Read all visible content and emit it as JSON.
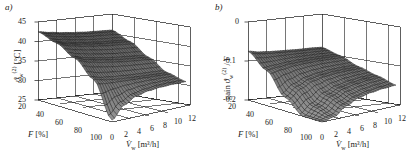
{
  "figure": {
    "background": "#ffffff",
    "ink": "#1a1a1a",
    "surface_mesh_color": "#1c1c1c",
    "surface_fill_color": "#8a8a8a",
    "panels": [
      {
        "tag": "a)",
        "zlabel_main": "ϑ",
        "zlabel_sub": "w",
        "zlabel_sup": "(2)",
        "zlabel_unit": "[°C]",
        "zlabel_full": "ϑw(2) [°C]",
        "ztitle_prefix": "",
        "zticks": [
          "45",
          "40",
          "35",
          "30",
          "25"
        ],
        "zlim": [
          25,
          45
        ],
        "xlabel_sym": "F",
        "xlabel_unit": "[%]",
        "xticks": [
          "20",
          "40",
          "60",
          "80",
          "100"
        ],
        "xlim": [
          20,
          100
        ],
        "ylabel_sym": "V̇",
        "ylabel_sub": "w",
        "ylabel_unit": "[m³/h]",
        "yticks": [
          "0",
          "2",
          "4",
          "6",
          "8",
          "10",
          "12"
        ],
        "ylim": [
          0,
          12
        ]
      },
      {
        "tag": "b)",
        "zlabel_main": "ϑ",
        "zlabel_sub": "w",
        "zlabel_sup": "(2)",
        "zlabel_unit": "",
        "zlabel_full": "gain ϑw(2) / F",
        "ztitle_prefix": "gain",
        "ztitle_suffix": "/ F",
        "zticks": [
          "0",
          "-0.1",
          "-0.2"
        ],
        "zlim": [
          -0.2,
          0
        ],
        "xlabel_sym": "F",
        "xlabel_unit": "[%]",
        "xticks": [
          "20",
          "40",
          "60",
          "80",
          "100"
        ],
        "xlim": [
          20,
          100
        ],
        "ylabel_sym": "V̇",
        "ylabel_sub": "w",
        "ylabel_unit": "[m³/h]",
        "yticks": [
          "0",
          "2",
          "4",
          "6",
          "8",
          "10",
          "12"
        ],
        "ylim": [
          0,
          12
        ]
      }
    ]
  },
  "chart_data": [
    {
      "type": "surface",
      "panel": "a",
      "title": "",
      "xlabel": "F [%]",
      "ylabel": "V̇w [m³/h]",
      "zlabel": "ϑw(2) [°C]",
      "xlim": [
        20,
        100
      ],
      "ylim": [
        0,
        12
      ],
      "zlim": [
        25,
        45
      ],
      "xticks": [
        20,
        40,
        60,
        80,
        100
      ],
      "yticks": [
        0,
        2,
        4,
        6,
        8,
        10,
        12
      ],
      "zticks": [
        25,
        30,
        35,
        40,
        45
      ],
      "grid": true,
      "legend": "none",
      "x": [
        20,
        40,
        60,
        80,
        100
      ],
      "y": [
        0,
        2,
        4,
        6,
        8,
        10,
        12
      ],
      "z": [
        [
          42.5,
          42.0,
          41.6,
          41.3,
          41.1,
          41.0,
          40.9
        ],
        [
          41.0,
          40.4,
          40.0,
          39.7,
          39.5,
          39.4,
          39.3
        ],
        [
          38.5,
          37.8,
          37.4,
          37.1,
          36.9,
          36.8,
          36.7
        ],
        [
          34.5,
          34.0,
          33.9,
          33.9,
          34.0,
          34.1,
          34.2
        ],
        [
          25.5,
          29.0,
          31.0,
          32.0,
          32.6,
          33.0,
          33.3
        ]
      ]
    },
    {
      "type": "surface",
      "panel": "b",
      "title": "",
      "xlabel": "F [%]",
      "ylabel": "V̇w [m³/h]",
      "zlabel": "gain ϑw(2) / F",
      "xlim": [
        20,
        100
      ],
      "ylim": [
        0,
        12
      ],
      "zlim": [
        -0.2,
        0
      ],
      "xticks": [
        20,
        40,
        60,
        80,
        100
      ],
      "yticks": [
        0,
        2,
        4,
        6,
        8,
        10,
        12
      ],
      "zticks": [
        0,
        -0.1,
        -0.2
      ],
      "grid": true,
      "legend": "none",
      "x": [
        20,
        40,
        60,
        80,
        100
      ],
      "y": [
        0,
        2,
        4,
        6,
        8,
        10,
        12
      ],
      "z": [
        [
          -0.075,
          -0.08,
          -0.082,
          -0.083,
          -0.084,
          -0.084,
          -0.085
        ],
        [
          -0.11,
          -0.105,
          -0.1,
          -0.097,
          -0.095,
          -0.094,
          -0.093
        ],
        [
          -0.165,
          -0.14,
          -0.125,
          -0.117,
          -0.112,
          -0.109,
          -0.107
        ],
        [
          -0.2,
          -0.175,
          -0.15,
          -0.135,
          -0.126,
          -0.12,
          -0.116
        ],
        [
          -0.2,
          -0.19,
          -0.165,
          -0.148,
          -0.138,
          -0.131,
          -0.126
        ]
      ]
    }
  ]
}
